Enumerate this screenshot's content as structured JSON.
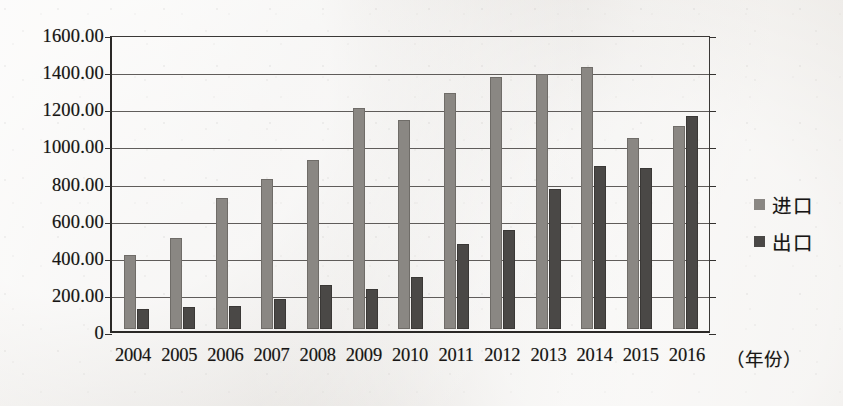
{
  "chart_data": {
    "type": "bar",
    "title": "",
    "xlabel": "（年份）",
    "ylabel": "",
    "ylim": [
      0,
      1600
    ],
    "ytick_labels": [
      "1600.00",
      "1400.00",
      "1200.00",
      "1000.00",
      "800.00",
      "600.00",
      "400.00",
      "200.00",
      "0"
    ],
    "ytick_values": [
      1600,
      1400,
      1200,
      1000,
      800,
      600,
      400,
      200,
      0
    ],
    "grid": true,
    "legend_position": "right",
    "categories": [
      "2004",
      "2005",
      "2006",
      "2007",
      "2008",
      "2009",
      "2010",
      "2011",
      "2012",
      "2013",
      "2014",
      "2015",
      "2016"
    ],
    "series": [
      {
        "name": "进口",
        "color": "#8a8783",
        "values": [
          400,
          490,
          705,
          810,
          910,
          1190,
          1125,
          1270,
          1355,
          1375,
          1410,
          1030,
          1095
        ]
      },
      {
        "name": "出口",
        "color": "#4a4846",
        "values": [
          110,
          120,
          125,
          160,
          235,
          215,
          280,
          460,
          535,
          755,
          880,
          870,
          1150
        ]
      }
    ]
  },
  "axis": {
    "x_note": "（年份）"
  }
}
